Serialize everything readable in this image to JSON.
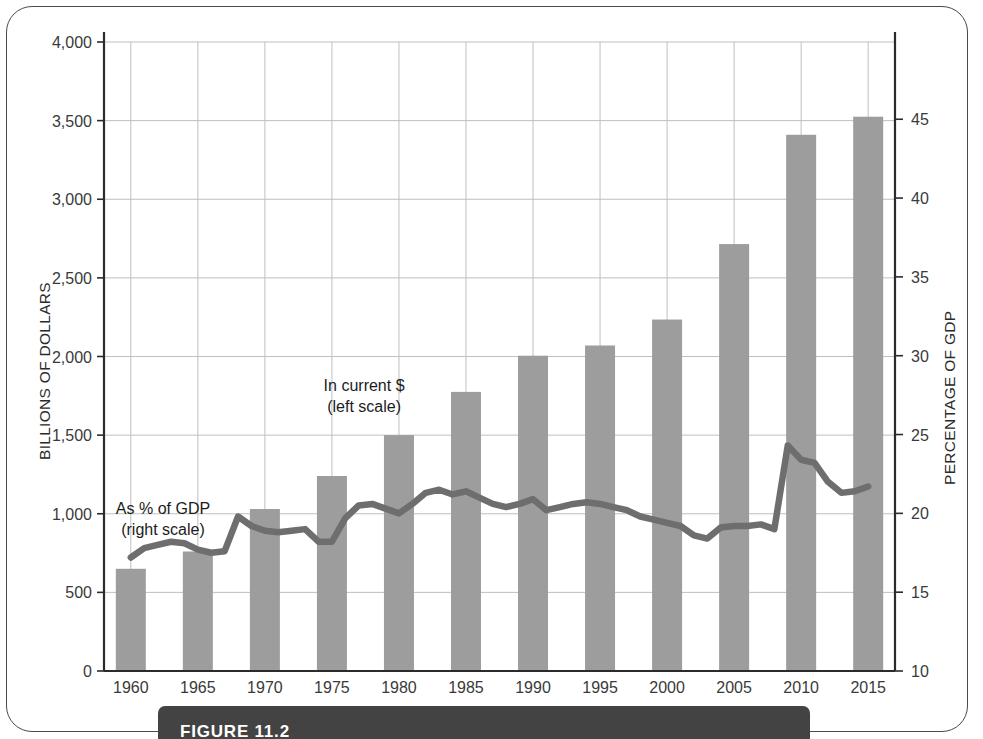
{
  "figure": {
    "caption_label": "FIGURE 11.2",
    "frame_color": "#4a4a4a",
    "caption_bar_color": "#434343"
  },
  "chart_data": {
    "type": "bar",
    "title": "",
    "subtitle": "",
    "xlabel": "",
    "ylabel": "BILLIONS OF DOLLARS",
    "y2label": "PERCENTAGE OF GDP",
    "grid": true,
    "legend_position": "inline-annotation",
    "bar_color": "#9d9d9d",
    "line_color": "#6e6e6e",
    "grid_color": "#bfbfbf",
    "axis_color": "#2b2b2b",
    "ylim": [
      0,
      4000
    ],
    "y2lim": [
      10,
      49.9
    ],
    "yticks": [
      0,
      500,
      1000,
      1500,
      2000,
      2500,
      3000,
      3500,
      4000
    ],
    "ytick_labels": [
      "0",
      "500",
      "1,000",
      "1,500",
      "2,000",
      "2,500",
      "3,000",
      "3,500",
      "4,000"
    ],
    "y2ticks": [
      10,
      15,
      20,
      25,
      30,
      35,
      40,
      45
    ],
    "y2tick_labels": [
      "10",
      "15",
      "20",
      "25",
      "30",
      "35",
      "40",
      "45"
    ],
    "xlim": [
      1958,
      2017
    ],
    "xticks": [
      1960,
      1965,
      1970,
      1975,
      1980,
      1985,
      1990,
      1995,
      2000,
      2005,
      2010,
      2015
    ],
    "xtick_labels": [
      "1960",
      "1965",
      "1970",
      "1975",
      "1980",
      "1985",
      "1990",
      "1995",
      "2000",
      "2005",
      "2010",
      "2015"
    ],
    "annotations": [
      {
        "id": "bars-note",
        "line1": "In current $",
        "line2": "(left scale)",
        "x": 1977.4,
        "y_px": 391
      },
      {
        "id": "line-note",
        "line1": "As % of GDP",
        "line2": "(right scale)",
        "x": 1962.4,
        "y_px": 514
      }
    ],
    "series": [
      {
        "name": "In current $ (left scale)",
        "type": "bar",
        "axis": "left",
        "units": "billions of dollars",
        "categories": [
          1960,
          1965,
          1970,
          1975,
          1980,
          1985,
          1990,
          1995,
          2000,
          2005,
          2010,
          2015
        ],
        "values": [
          650,
          760,
          1030,
          1240,
          1500,
          1775,
          2005,
          2070,
          2235,
          2715,
          3410,
          3525
        ]
      },
      {
        "name": "As % of GDP (right scale)",
        "type": "line",
        "axis": "right",
        "units": "percent of GDP",
        "x": [
          1960,
          1961,
          1962,
          1963,
          1964,
          1965,
          1966,
          1967,
          1968,
          1969,
          1970,
          1971,
          1972,
          1973,
          1974,
          1975,
          1976,
          1977,
          1978,
          1979,
          1980,
          1981,
          1982,
          1983,
          1984,
          1985,
          1986,
          1987,
          1988,
          1989,
          1990,
          1991,
          1992,
          1993,
          1994,
          1995,
          1996,
          1997,
          1998,
          1999,
          2000,
          2001,
          2002,
          2003,
          2004,
          2005,
          2006,
          2007,
          2008,
          2009,
          2010,
          2011,
          2012,
          2013,
          2014,
          2015
        ],
        "values": [
          17.2,
          17.8,
          18.0,
          18.2,
          18.1,
          17.7,
          17.5,
          17.6,
          19.8,
          19.2,
          18.9,
          18.8,
          18.9,
          19.0,
          18.2,
          18.2,
          19.7,
          20.5,
          20.6,
          20.3,
          20.0,
          20.6,
          21.3,
          21.5,
          21.2,
          21.4,
          21.0,
          20.6,
          20.4,
          20.6,
          20.9,
          20.2,
          20.4,
          20.6,
          20.7,
          20.6,
          20.4,
          20.2,
          19.8,
          19.6,
          19.4,
          19.2,
          18.6,
          18.4,
          19.1,
          19.2,
          19.2,
          19.3,
          19.0,
          24.3,
          23.4,
          23.2,
          22.0,
          21.3,
          21.4,
          21.7
        ]
      }
    ]
  }
}
